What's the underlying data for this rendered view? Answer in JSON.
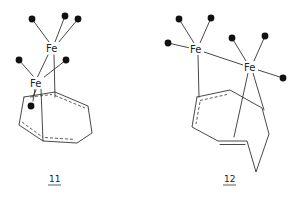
{
  "figure": {
    "type": "chemical-structures",
    "compounds": [
      {
        "id": "11",
        "label": "11",
        "metal_atoms": [
          {
            "symbol": "Fe",
            "position": "upper",
            "carbonyl_ligands": 3
          },
          {
            "symbol": "Fe",
            "position": "lower",
            "carbonyl_ligands": 3
          }
        ],
        "ring": "cyclooctatetraene (eight-membered ring, partially dashed delocalized bonds)"
      },
      {
        "id": "12",
        "label": "12",
        "metal_atoms": [
          {
            "symbol": "Fe",
            "position": "left",
            "carbonyl_ligands": 3
          },
          {
            "symbol": "Fe",
            "position": "right",
            "carbonyl_ligands": 3
          }
        ],
        "ring": "eight-membered ring in tub conformation with one C=C double bond and one dashed delocalized segment"
      }
    ],
    "legend": {
      "filled_circle": "CO ligand"
    }
  },
  "labels": {
    "fe": "Fe",
    "c11": "11",
    "c12": "12"
  },
  "colors": {
    "bond": "#333333",
    "ligand": "#111111",
    "background": "#ffffff"
  }
}
